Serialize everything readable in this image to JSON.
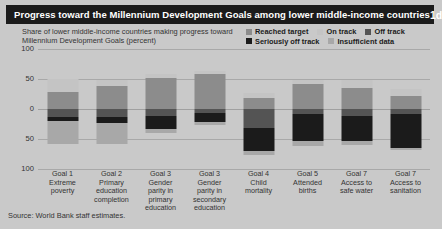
{
  "header": {
    "title": "Progress toward the Millennium Development Goals among lower middle-income countries",
    "figure_number": "1d"
  },
  "subtitle": "Share of lower middle-income countries making progress toward Millennium Development Goals (percent)",
  "source": "Source: World Bank staff estimates.",
  "legend": {
    "items": [
      {
        "label": "Reached target",
        "color": "#8c8c8c"
      },
      {
        "label": "On track",
        "color": "#c4c4c4"
      },
      {
        "label": "Off track",
        "color": "#545454"
      },
      {
        "label": "Seriously off track",
        "color": "#1b1b1b"
      },
      {
        "label": "Insufficient data",
        "color": "#a8a8a8"
      }
    ]
  },
  "chart_data": {
    "type": "bar",
    "title": "Progress toward the Millennium Development Goals among lower middle-income countries",
    "subtitle": "Share of lower middle-income countries making progress toward Millennium Development Goals (percent)",
    "xlabel": "",
    "ylabel": "Share of countries (percent)",
    "ylim": [
      -100,
      100
    ],
    "yticks": [
      100,
      50,
      0,
      -50,
      -100
    ],
    "ytick_labels": [
      "100",
      "50",
      "0",
      "50",
      "100"
    ],
    "grid": true,
    "legend_position": "top-right",
    "note": "Positive values (above zero) show countries reaching target / on track; negative values (below zero) show off track, seriously off track and insufficient data.",
    "categories": [
      "Goal 1 Extreme poverty",
      "Goal 2 Primary education completion",
      "Goal 3 Gender parity in primary education",
      "Goal 3 Gender parity in secondary education",
      "Goal 4 Child mortality",
      "Goal 5 Attended births",
      "Goal 7 Access to safe water",
      "Goal 7 Access to sanitation"
    ],
    "category_lines": [
      [
        "Goal 1",
        "Extreme",
        "poverty"
      ],
      [
        "Goal 2",
        "Primary",
        "education",
        "completion"
      ],
      [
        "Goal 3",
        "Gender",
        "parity in",
        "primary",
        "education"
      ],
      [
        "Goal 3",
        "Gender",
        "parity in",
        "secondary",
        "education"
      ],
      [
        "Goal 4",
        "Child",
        "mortality"
      ],
      [
        "Goal 5",
        "Attended",
        "births"
      ],
      [
        "Goal 7",
        "Access to",
        "safe water"
      ],
      [
        "Goal 7",
        "Access to",
        "sanitation"
      ]
    ],
    "series": [
      {
        "name": "Reached target",
        "color": "#8c8c8c",
        "values": [
          28,
          38,
          52,
          58,
          18,
          42,
          35,
          22
        ]
      },
      {
        "name": "On track",
        "color": "#c4c4c4",
        "values": [
          22,
          10,
          6,
          5,
          8,
          6,
          13,
          11
        ]
      },
      {
        "name": "Off track",
        "color": "#545454",
        "values": [
          -14,
          -13,
          -12,
          -6,
          -32,
          -8,
          -12,
          -9
        ]
      },
      {
        "name": "Seriously off track",
        "color": "#1b1b1b",
        "values": [
          -6,
          -10,
          -22,
          -15,
          -38,
          -46,
          -42,
          -56
        ]
      },
      {
        "name": "Insufficient data",
        "color": "#a8a8a8",
        "values": [
          -38,
          -36,
          -6,
          -6,
          -6,
          -8,
          -6,
          -4
        ]
      }
    ]
  }
}
